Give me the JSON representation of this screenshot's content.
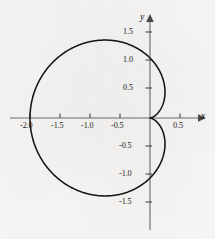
{
  "figure": {
    "background_color": "#f8f7f5",
    "axis_color": "#6e6e6e",
    "curve_color": "#141414",
    "text_color": "#1a1a1a",
    "x_axis_name": "x",
    "y_axis_name": "y"
  },
  "chart_data": {
    "type": "line",
    "title": "",
    "subtitle": "",
    "xlabel": "x",
    "ylabel": "y",
    "grid": false,
    "legend_position": "none",
    "curve_name": "cardioid",
    "polar_equation": "r = 1 - cos(theta)",
    "xlim": [
      -2.15,
      0.8
    ],
    "ylim": [
      -1.75,
      1.75
    ],
    "x_ticks": [
      "-2.0",
      "-1.5",
      "-1.0",
      "-0.5",
      "0.5"
    ],
    "x_tick_values": [
      -2.0,
      -1.5,
      -1.0,
      -0.5,
      0.5
    ],
    "y_ticks": [
      "1.5",
      "1.0",
      "0.5",
      "-0.5",
      "-1.0",
      "-1.5"
    ],
    "y_tick_values": [
      1.5,
      1.0,
      0.5,
      -0.5,
      -1.0,
      -1.5
    ],
    "annotations": [],
    "key_points": [
      {
        "label": "cusp at origin",
        "x": 0.0,
        "y": 0.0
      },
      {
        "label": "leftmost point",
        "x": -2.0,
        "y": 0.0
      },
      {
        "label": "upper y-intercept",
        "x": 0.0,
        "y": 1.0
      },
      {
        "label": "lower y-intercept",
        "x": 0.0,
        "y": -1.0
      },
      {
        "label": "upper lobe max x",
        "x": 0.35,
        "y": 0.65
      },
      {
        "label": "lower lobe max x",
        "x": 0.35,
        "y": -0.65
      },
      {
        "label": "top of curve",
        "x": -0.75,
        "y": 1.3
      },
      {
        "label": "bottom of curve",
        "x": -0.75,
        "y": -1.3
      }
    ],
    "points": [
      {
        "x": 0.0,
        "y": 0.0
      },
      {
        "x": -0.0037,
        "y": 0.0605
      },
      {
        "x": -0.0294,
        "y": 0.171
      },
      {
        "x": -0.0954,
        "y": 0.3248
      },
      {
        "x": -0.2097,
        "y": 0.4981
      },
      {
        "x": -0.375,
        "y": 0.6629
      },
      {
        "x": -0.5865,
        "y": 0.7928
      },
      {
        "x": -0.8314,
        "y": 0.866
      },
      {
        "x": -1.0908,
        "y": 0.8705
      },
      {
        "x": -1.3427,
        "y": 0.8063
      },
      {
        "x": -1.565,
        "y": 0.6845
      },
      {
        "x": -1.7388,
        "y": 0.5245
      },
      {
        "x": -1.852,
        "y": 0.3488
      },
      {
        "x": -1.9606,
        "y": 0.1762
      },
      {
        "x": -2.0,
        "y": 0.0
      },
      {
        "x": -1.9606,
        "y": -0.1762
      },
      {
        "x": -1.852,
        "y": -0.3488
      },
      {
        "x": -1.7388,
        "y": -0.5245
      },
      {
        "x": -1.565,
        "y": -0.6845
      },
      {
        "x": -1.3427,
        "y": -0.8063
      },
      {
        "x": -1.0908,
        "y": -0.8705
      },
      {
        "x": -0.8314,
        "y": -0.866
      },
      {
        "x": -0.5865,
        "y": -0.7928
      },
      {
        "x": -0.375,
        "y": -0.6629
      },
      {
        "x": -0.2097,
        "y": -0.4981
      },
      {
        "x": -0.0954,
        "y": -0.3248
      },
      {
        "x": -0.0294,
        "y": -0.171
      },
      {
        "x": -0.0037,
        "y": -0.0605
      },
      {
        "x": 0.0,
        "y": 0.0
      }
    ]
  },
  "x_tick_labels": [
    {
      "text": "-2.0",
      "left": 20,
      "top": 121
    },
    {
      "text": "-1.5",
      "left": 51,
      "top": 121
    },
    {
      "text": "-1.0",
      "left": 81,
      "top": 121
    },
    {
      "text": "-0.5",
      "left": 111,
      "top": 121
    },
    {
      "text": "0.5",
      "left": 173,
      "top": 121
    }
  ],
  "y_tick_labels": [
    {
      "text": "1.5",
      "left": 123,
      "top": 28
    },
    {
      "text": "1.0",
      "left": 123,
      "top": 56
    },
    {
      "text": "0.5",
      "left": 123,
      "top": 84
    },
    {
      "text": "-0.5",
      "left": 119,
      "top": 140
    },
    {
      "text": "-1.0",
      "left": 119,
      "top": 168
    },
    {
      "text": "-1.5",
      "left": 119,
      "top": 196
    }
  ],
  "axis_names": [
    {
      "name": "y",
      "left": 141,
      "top": 12
    },
    {
      "name": "x",
      "left": 200,
      "top": 112
    }
  ]
}
